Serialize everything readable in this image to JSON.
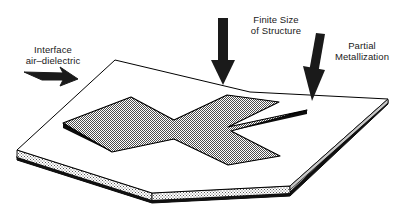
{
  "figure": {
    "type": "3d-technical-diagram",
    "canvas": {
      "width": 397,
      "height": 221
    },
    "background_color": "#ffffff"
  },
  "annotations": [
    {
      "id": "interface",
      "line1": "Interface",
      "line2": "air–dielectric",
      "arrow": "diagonal-arrow-down-right",
      "points_to": "substrate-top-surface"
    },
    {
      "id": "finite-size",
      "line1": "Finite Size",
      "line2": "of Structure",
      "arrow": "vertical-arrow-down",
      "points_to": "substrate-edge"
    },
    {
      "id": "partial-metallization",
      "line1": "Partial",
      "line2": "Metallization",
      "arrow": "slanted-arrow-down",
      "points_to": "cross-patch-arm"
    }
  ],
  "structure": {
    "substrate": {
      "name": "dielectric-substrate-slab",
      "top_face_color": "#ffffff",
      "side_face_color": "#d9d9d9",
      "outline_color": "#000000",
      "bottom_shadow_color": "#111111"
    },
    "patch": {
      "name": "cross-shaped-metallization",
      "shape": "X-cross",
      "fill_color": "#a8a8a8",
      "edge_color": "#000000",
      "thickness_shadow_color": "#0d0d0d"
    }
  },
  "colors": {
    "ink": "#000000",
    "text": "#1a1a1a",
    "metal_gray": "#a8a8a8",
    "substrate_gray": "#d9d9d9",
    "white": "#ffffff"
  }
}
